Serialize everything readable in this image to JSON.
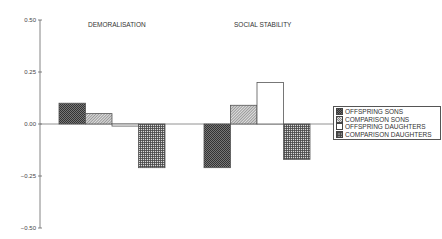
{
  "chart_data": {
    "type": "bar",
    "title": "",
    "xlabel": "",
    "ylabel": "",
    "categories": [
      "DEMORALISATION",
      "SOCIAL STABILITY"
    ],
    "series": [
      {
        "name": "OFFSPRING SONS",
        "values": [
          0.1,
          -0.21
        ],
        "pattern": "checker"
      },
      {
        "name": "COMPARISON SONS",
        "values": [
          0.05,
          0.09
        ],
        "pattern": "hatch"
      },
      {
        "name": "OFFSPRING DAUGHTERS",
        "values": [
          -0.01,
          0.2
        ],
        "pattern": "white"
      },
      {
        "name": "COMPARISON DAUGHTERS",
        "values": [
          -0.21,
          -0.17
        ],
        "pattern": "grid"
      }
    ],
    "ylim": [
      -0.5,
      0.5
    ],
    "yticks": [
      "0.50",
      "0.25",
      "0.00",
      "−0.25",
      "−0.50"
    ],
    "grid": false,
    "legend_position": "right"
  },
  "legend": {
    "items": [
      {
        "label": "OFFSPRING SONS"
      },
      {
        "label": "COMPARISON SONS"
      },
      {
        "label": "OFFSPRING DAUGHTERS"
      },
      {
        "label": "COMPARISON DAUGHTERS"
      }
    ]
  }
}
